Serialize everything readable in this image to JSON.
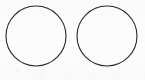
{
  "figure": {
    "kind": "line-drawing",
    "width": 145,
    "height": 80,
    "background_color": "#fdfdfd",
    "stroke_color": "#262626",
    "stroke_width": 1.1,
    "shape_count": 2,
    "shapes": [
      {
        "name": "left-circle",
        "type": "circle",
        "cx": 36,
        "cy": 36,
        "r": 30,
        "fill": "none",
        "label": ""
      },
      {
        "name": "right-circle",
        "type": "circle",
        "cx": 107,
        "cy": 36,
        "r": 30,
        "fill": "none",
        "label": ""
      }
    ]
  }
}
